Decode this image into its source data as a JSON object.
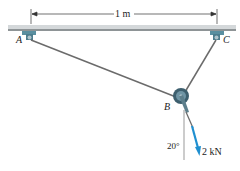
{
  "diagram": {
    "dimension_label": "1 m",
    "points": {
      "A": "A",
      "B": "B",
      "C": "C"
    },
    "angle_label": "20°",
    "force_label": "2 kN",
    "colors": {
      "bar": "#c8cdd0",
      "support": "#5a8fa0",
      "cable": "#666666",
      "force": "#1f8fd0"
    }
  }
}
